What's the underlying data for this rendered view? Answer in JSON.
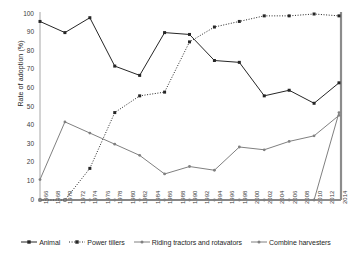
{
  "axis": {
    "ylabel": "Rate of adoption (%)",
    "yticks": [
      0,
      10,
      20,
      30,
      40,
      50,
      60,
      70,
      80,
      90,
      100
    ],
    "ylim": [
      0,
      100
    ],
    "xticks": [
      "1966",
      "1968",
      "1970",
      "1972",
      "1974",
      "1976",
      "1978",
      "1980",
      "1982",
      "1984",
      "1986",
      "1988",
      "1990",
      "1992",
      "1994",
      "1996",
      "1998",
      "2000",
      "2002",
      "2004",
      "2006",
      "2008",
      "2010",
      "2012",
      "2014"
    ]
  },
  "legend": {
    "position": "bottom",
    "items": [
      {
        "label": "Animal",
        "key": "animal-legend-key"
      },
      {
        "label": "Power tillers",
        "key": "power-tillers-legend-key"
      },
      {
        "label": "Riding tractors and rotavators",
        "key": "riding-tractors-legend-key"
      },
      {
        "label": "Combine harvesters",
        "key": "combine-harvesters-legend-key"
      }
    ]
  },
  "colors": {
    "animal": "#262626",
    "power_tillers": "#262626",
    "riding_tractors": "#808080",
    "combine_harvesters": "#808080",
    "axis": "#a6a6a6",
    "text": "#3b3b3b"
  },
  "chart_data": {
    "type": "line",
    "title": "",
    "xlabel": "",
    "ylabel": "Rate of adoption (%)",
    "ylim": [
      0,
      100
    ],
    "grid": false,
    "legend_position": "bottom",
    "x": [
      "1966",
      "1968",
      "1970",
      "1972",
      "1974",
      "1976",
      "1978",
      "1980",
      "1982",
      "1984",
      "1986",
      "1988",
      "1990",
      "1992",
      "1994",
      "1996",
      "1998",
      "2000",
      "2002",
      "2004",
      "2006",
      "2008",
      "2010",
      "2012",
      "2014"
    ],
    "series": [
      {
        "name": "Animal",
        "style": "solid",
        "color": "#262626",
        "marker": "square",
        "x": [
          "1966",
          "1970",
          "1974",
          "1978",
          "1982",
          "1986",
          "1990",
          "1994",
          "1998",
          "2002",
          "2006",
          "2010",
          "2014"
        ],
        "values": [
          96,
          90,
          98,
          72,
          67,
          90,
          89,
          75,
          74,
          56,
          59,
          52,
          63
        ]
      },
      {
        "name": "Power tillers",
        "style": "dotted",
        "color": "#262626",
        "marker": "square",
        "x": [
          "1966",
          "1970",
          "1974",
          "1978",
          "1982",
          "1986",
          "1990",
          "1994",
          "1998",
          "2002",
          "2006",
          "2010",
          "2014"
        ],
        "values": [
          0,
          0,
          17,
          47,
          56,
          58,
          85,
          93,
          96,
          99,
          99,
          100,
          99
        ]
      },
      {
        "name": "Riding tractors and rotavators",
        "style": "solid",
        "color": "#808080",
        "marker": "dot",
        "x": [
          "1966",
          "1970",
          "1974",
          "1978",
          "1982",
          "1986",
          "1990",
          "1994",
          "1998",
          "2002",
          "2006",
          "2010",
          "2014"
        ],
        "values": [
          11,
          42,
          36,
          30,
          24,
          14,
          18,
          16,
          28.5,
          27,
          31.5,
          34.5,
          45.5
        ]
      },
      {
        "name": "Combine harvesters",
        "style": "solid",
        "color": "#808080",
        "marker": "dot",
        "x": [
          "1966",
          "1970",
          "1974",
          "1978",
          "1982",
          "1986",
          "1990",
          "1994",
          "1998",
          "2002",
          "2006",
          "2010",
          "2014"
        ],
        "values": [
          0,
          0,
          0,
          0,
          0,
          0,
          0,
          0,
          0,
          0,
          0,
          0,
          47
        ]
      }
    ]
  }
}
